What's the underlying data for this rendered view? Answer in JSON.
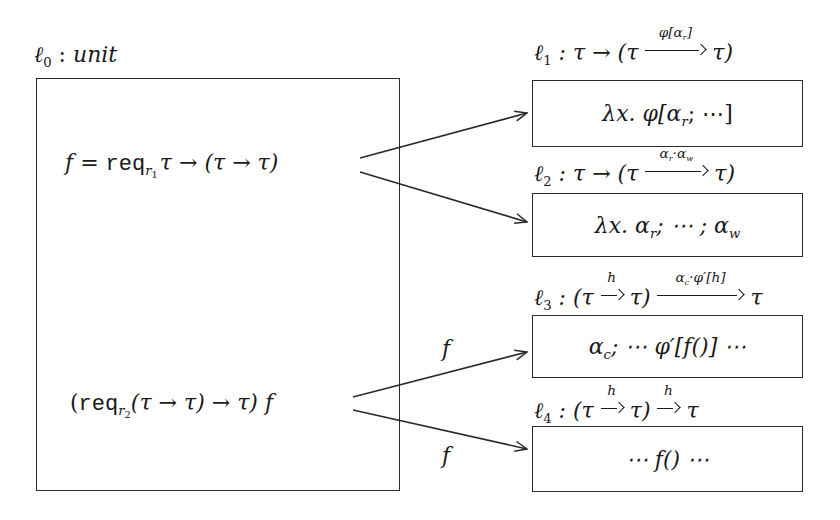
{
  "diagram": {
    "source_box": {
      "label": {
        "ell": "ℓ",
        "index": "0",
        "sep": " : ",
        "type": "unit"
      },
      "expr1": {
        "f": "f",
        "eq": " = ",
        "req": "req",
        "sub": "r",
        "subsub": "1",
        "rest": "τ → (τ → τ)"
      },
      "expr2": {
        "open": "(",
        "req": "req",
        "sub": "r",
        "subsub": "2",
        "rest": "(τ → τ) → τ)",
        "f": "f"
      }
    },
    "targets": [
      {
        "label_ell": "ℓ",
        "label_index": "1",
        "label_pre": " : τ → (τ ",
        "arrow_annotation": "φ[α",
        "arrow_annotation_sub": "r",
        "arrow_annotation_post": "]",
        "label_post": " τ)",
        "body": "λx. φ[α",
        "body_sub": "r",
        "body_post": "; ⋯]"
      },
      {
        "label_ell": "ℓ",
        "label_index": "2",
        "label_pre": " : τ → (τ ",
        "arrow_annotation": "α",
        "arrow_annotation_sub": "r",
        "arrow_annotation_mid": "·α",
        "arrow_annotation_sub2": "w",
        "label_post": " τ)",
        "body": "λx. α",
        "body_sub": "r",
        "body_mid": "; ⋯ ; α",
        "body_sub2": "w"
      },
      {
        "label_ell": "ℓ",
        "label_index": "3",
        "label_pre": " : (τ ",
        "small_arrow_annotation": "h",
        "label_mid": " τ) ",
        "arrow_annotation": "α",
        "arrow_annotation_sub": "c",
        "arrow_annotation_post": "·φ′[h]",
        "label_post": " τ",
        "body": "α",
        "body_sub": "c",
        "body_post": "; ⋯ φ′[f()] ⋯"
      },
      {
        "label_ell": "ℓ",
        "label_index": "4",
        "label_pre": " : (τ ",
        "small_arrow_annotation": "h",
        "label_mid": " τ) ",
        "second_arrow_annotation": "h",
        "label_post": " τ",
        "body": "⋯ f() ⋯"
      }
    ],
    "edges": [
      {
        "from": "expr1",
        "to": "target1",
        "label": ""
      },
      {
        "from": "expr1",
        "to": "target2",
        "label": ""
      },
      {
        "from": "expr2",
        "to": "target3",
        "label": "f"
      },
      {
        "from": "expr2",
        "to": "target4",
        "label": "f"
      }
    ],
    "colors": {
      "stroke": "#2a2a2a",
      "text": "#1a1a1a",
      "background": "#ffffff"
    }
  }
}
